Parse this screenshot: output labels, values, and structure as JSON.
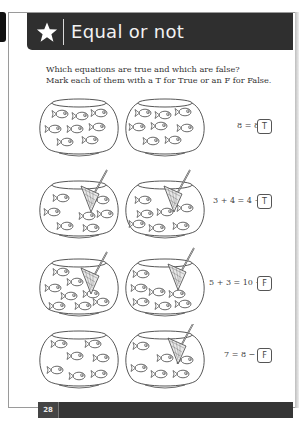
{
  "header": {
    "icon": "star-icon",
    "title": "Equal or not"
  },
  "instructions": [
    "Which equations are true and which are false?",
    "Mark each of them with a T for True or an F for False."
  ],
  "rows": [
    {
      "left_bowl": "fishbowl with 8 fish",
      "right_bowl": "fishbowl with 8 fish",
      "equation": "8 = 8",
      "answer": "T"
    },
    {
      "left_bowl": "fishbowl with fish and net",
      "right_bowl": "fishbowl with fish and net",
      "equation": "3 + 4 = 4 + 3",
      "answer": "T"
    },
    {
      "left_bowl": "fishbowl with fish and net",
      "right_bowl": "fishbowl with fish and full net",
      "equation": "5 + 3 = 10 − 3",
      "answer": "F"
    },
    {
      "left_bowl": "fishbowl with 7 fish",
      "right_bowl": "fishbowl with fish and net",
      "equation": "7 = 8 − 2",
      "answer": "F"
    }
  ],
  "footer": {
    "page_number": "28"
  }
}
